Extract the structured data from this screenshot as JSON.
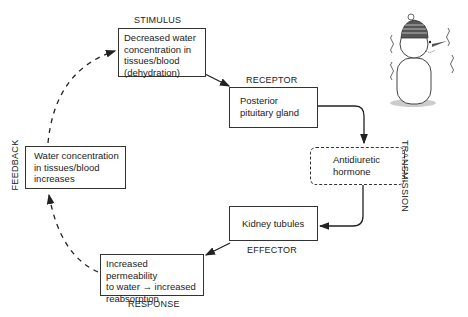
{
  "diagram": {
    "stages": {
      "stimulus": {
        "label": "STIMULUS",
        "text": "Decreased water concentration in tissues/blood (dehydration)"
      },
      "receptor": {
        "label": "RECEPTOR",
        "text": "Posterior pituitary gland"
      },
      "transmission": {
        "label": "TRANSMISSION",
        "text": "Antidiuretic hormone"
      },
      "effector": {
        "label": "EFFECTOR",
        "text": "Kidney tubules"
      },
      "response": {
        "label": "RESPONSE",
        "text_line1": "Increased permeability",
        "text_line2a": "to water",
        "arrow": "→",
        "text_line2b": "increased",
        "text_line3": "reabsorption"
      },
      "feedback": {
        "label": "FEEDBACK",
        "text": "Water concentration in tissues/blood increases"
      }
    },
    "illustration": "shivering-snowman"
  }
}
